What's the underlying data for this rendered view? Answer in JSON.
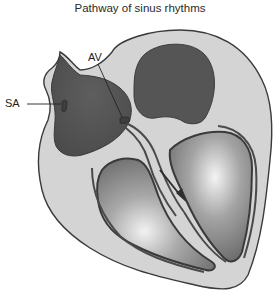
{
  "diagram": {
    "title": "Pathway of sinus rhythms",
    "labels": {
      "sa": "SA",
      "av": "AV"
    },
    "colors": {
      "wall": "#d4d4d4",
      "outline": "#3a3a3a",
      "chamber_dark": "#555555",
      "chamber_light": "#9a9a9a",
      "conduction": "#4a4a4a"
    }
  }
}
